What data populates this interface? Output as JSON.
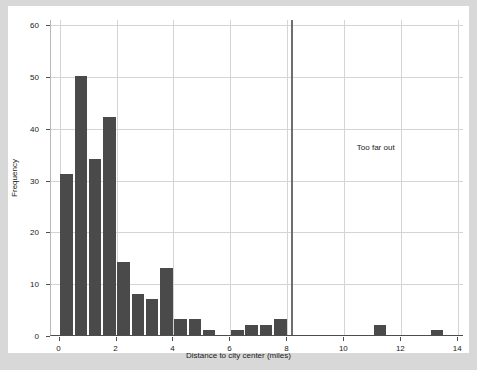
{
  "chart_data": {
    "type": "bar",
    "title": "",
    "xlabel": "Distance to city center (miles)",
    "ylabel": "Frequency",
    "xlim": [
      -0.3,
      14.2
    ],
    "ylim": [
      0,
      61
    ],
    "grid": true,
    "legend": null,
    "bin_width": 0.5,
    "xticks": [
      0,
      2,
      4,
      6,
      8,
      10,
      12,
      14
    ],
    "xtick_labels": [
      "0",
      "2",
      "4",
      "6",
      "8",
      "10",
      "12",
      "14"
    ],
    "yticks": [
      0,
      10,
      20,
      30,
      40,
      50,
      60
    ],
    "ytick_labels": [
      "0",
      "10",
      "20",
      "30",
      "40",
      "50",
      "60"
    ],
    "bar_color": "#4a4a4a",
    "bins": [
      {
        "x0": 0.0,
        "x1": 0.5,
        "value": 31
      },
      {
        "x0": 0.5,
        "x1": 1.0,
        "value": 50
      },
      {
        "x0": 1.0,
        "x1": 1.5,
        "value": 34
      },
      {
        "x0": 1.5,
        "x1": 2.0,
        "value": 42
      },
      {
        "x0": 2.0,
        "x1": 2.5,
        "value": 14
      },
      {
        "x0": 2.5,
        "x1": 3.0,
        "value": 8
      },
      {
        "x0": 3.0,
        "x1": 3.5,
        "value": 7
      },
      {
        "x0": 3.5,
        "x1": 4.0,
        "value": 13
      },
      {
        "x0": 4.0,
        "x1": 4.5,
        "value": 3
      },
      {
        "x0": 4.5,
        "x1": 5.0,
        "value": 3
      },
      {
        "x0": 5.0,
        "x1": 5.5,
        "value": 1
      },
      {
        "x0": 5.5,
        "x1": 6.0,
        "value": 0
      },
      {
        "x0": 6.0,
        "x1": 6.5,
        "value": 1
      },
      {
        "x0": 6.5,
        "x1": 7.0,
        "value": 2
      },
      {
        "x0": 7.0,
        "x1": 7.5,
        "value": 2
      },
      {
        "x0": 7.5,
        "x1": 8.0,
        "value": 3
      },
      {
        "x0": 8.0,
        "x1": 8.5,
        "value": 0
      },
      {
        "x0": 11.0,
        "x1": 11.5,
        "value": 2
      },
      {
        "x0": 13.0,
        "x1": 13.5,
        "value": 1
      }
    ],
    "annotations": [
      {
        "text": "Too far out",
        "x": 11.1,
        "y": 36.5,
        "color": "#1a1a1a"
      }
    ],
    "vertical_lines": [
      {
        "x": 8.12,
        "color": "#6f6f6f",
        "width_px": 2
      }
    ]
  }
}
